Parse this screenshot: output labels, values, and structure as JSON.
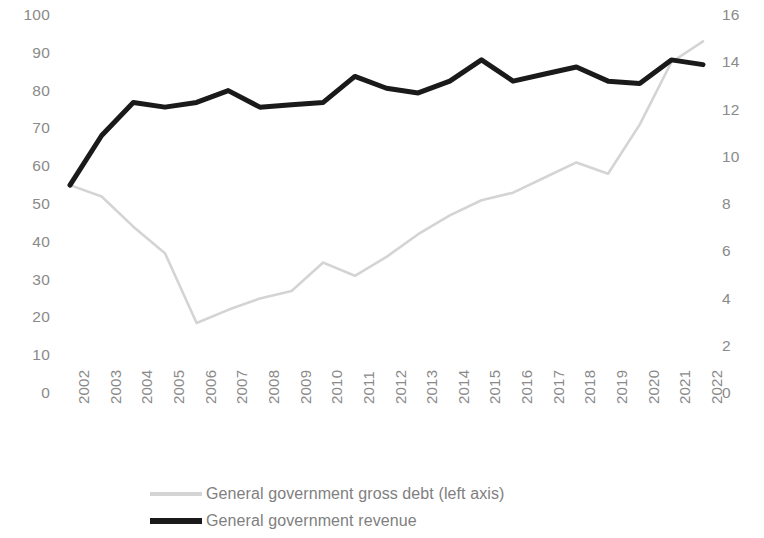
{
  "chart_data": {
    "type": "line",
    "title": "",
    "subtitle": "",
    "xlabel": "",
    "ylabel": "",
    "grid": false,
    "legend_position": "bottom-left",
    "categories": [
      "2002",
      "2003",
      "2004",
      "2005",
      "2006",
      "2007",
      "2008",
      "2009",
      "2010",
      "2011",
      "2012",
      "2013",
      "2014",
      "2015",
      "2016",
      "2017",
      "2018",
      "2019",
      "2020",
      "2021",
      "2022"
    ],
    "axes": {
      "left": {
        "label": "",
        "min": 0,
        "max": 100,
        "step": 10,
        "ticks": [
          "100",
          "90",
          "80",
          "70",
          "60",
          "50",
          "40",
          "30",
          "20",
          "10",
          "0"
        ],
        "tick_values": [
          100,
          90,
          80,
          70,
          60,
          50,
          40,
          30,
          20,
          10,
          0
        ]
      },
      "right": {
        "label": "",
        "min": 0,
        "max": 16,
        "step": 2,
        "ticks": [
          "16",
          "14",
          "12",
          "10",
          "8",
          "6",
          "4",
          "2",
          "0"
        ],
        "tick_values": [
          16,
          14,
          12,
          10,
          8,
          6,
          4,
          2,
          0
        ]
      }
    },
    "series": [
      {
        "name": "General government gross debt (left axis)",
        "axis": "left",
        "color": "#d4d4d4",
        "line_width": 2.6,
        "values": [
          55,
          52,
          44,
          37,
          18.5,
          22,
          25,
          27,
          34.5,
          31,
          36,
          42,
          47,
          51,
          53,
          57,
          61,
          58,
          71,
          87.5,
          93
        ]
      },
      {
        "name": "General government revenue",
        "axis": "right",
        "color": "#1a1a1a",
        "line_width": 5,
        "values": [
          8.8,
          10.9,
          12.3,
          12.1,
          12.3,
          12.8,
          12.1,
          12.2,
          12.3,
          13.4,
          12.9,
          12.7,
          13.2,
          14.1,
          13.2,
          13.5,
          13.8,
          13.2,
          13.1,
          14.1,
          13.9
        ]
      }
    ]
  },
  "legend": {
    "items": [
      {
        "label": "General government gross debt (left axis)",
        "style": "debt"
      },
      {
        "label": "General government revenue",
        "style": "revenue"
      }
    ]
  },
  "colors": {
    "debt_line": "#d4d4d4",
    "revenue_line": "#1a1a1a",
    "tick_text": "#8a8a8a",
    "legend_text": "#808080",
    "background": "#ffffff"
  }
}
